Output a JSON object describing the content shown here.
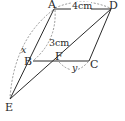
{
  "figure": {
    "type": "parallelogram-geometry",
    "points": {
      "A": {
        "label": "A",
        "x": 54,
        "y": 9
      },
      "B": {
        "label": "B",
        "x": 33,
        "y": 61
      },
      "C": {
        "label": "C",
        "x": 89,
        "y": 61
      },
      "D": {
        "label": "D",
        "x": 111,
        "y": 9
      },
      "E": {
        "label": "E",
        "x": 10,
        "y": 99
      },
      "F": {
        "label": "F",
        "x": 58,
        "y": 61
      }
    },
    "measurements": {
      "AD": "4cm",
      "AB": "3cm",
      "AE": "x",
      "FC": "y"
    },
    "colors": {
      "line": "#2a2a2a",
      "dashed": "#8a8a8a",
      "background": "#ffffff"
    }
  }
}
